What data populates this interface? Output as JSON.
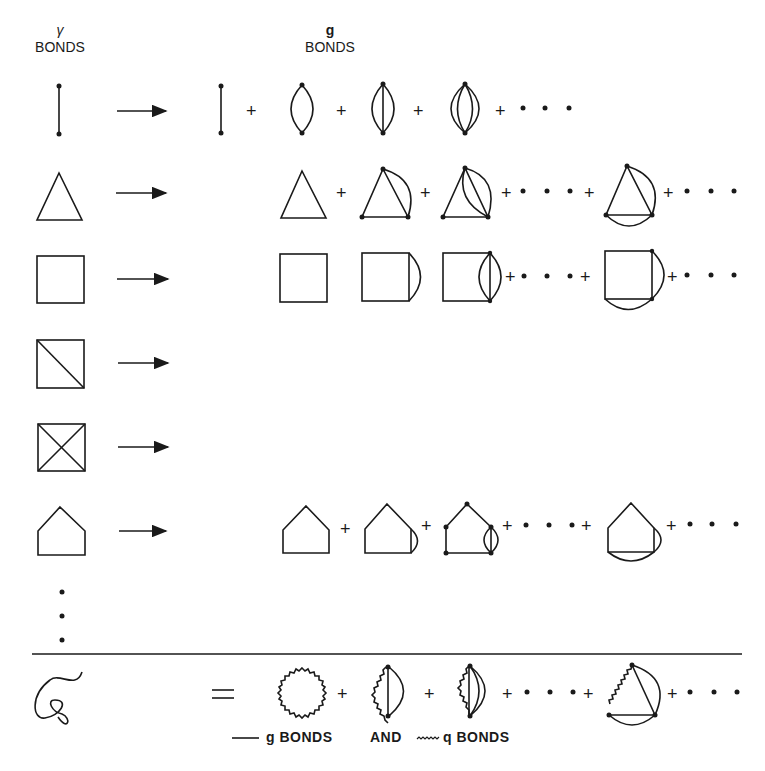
{
  "headers": {
    "left": {
      "symbol": "γ",
      "label": "BONDS"
    },
    "right": {
      "symbol": "g",
      "label": "BONDS"
    }
  },
  "rows": [
    {
      "name": "single-bond",
      "lhs": "line",
      "arrow": true,
      "rhs_terms": [
        "line",
        "+",
        "lens-2",
        "+",
        "lens-3",
        "+",
        "lens-4",
        "+ · · ·"
      ]
    },
    {
      "name": "triangle",
      "lhs": "triangle",
      "arrow": true,
      "rhs_terms": [
        "triangle",
        "+",
        "triangle-1arc",
        "+",
        "triangle-2arc",
        "+ · · · +",
        "triangle-2arcs-sides",
        "+ · · ·"
      ]
    },
    {
      "name": "square",
      "lhs": "square",
      "arrow": true,
      "rhs_terms": [
        "square",
        "square-1arc",
        "square-2arc",
        "+ · · · +",
        "square-2arcs-sides",
        "+ · · ·"
      ]
    },
    {
      "name": "square-diagonal",
      "lhs": "square-one-diagonal",
      "arrow": true,
      "rhs_terms": []
    },
    {
      "name": "square-cross",
      "lhs": "square-two-diagonals",
      "arrow": true,
      "rhs_terms": []
    },
    {
      "name": "pentagon",
      "lhs": "pentagon",
      "arrow": true,
      "rhs_terms": [
        "pentagon",
        "+",
        "pentagon-1arc",
        "+",
        "pentagon-2arc",
        "+ · · · +",
        "pentagon-2arcs-sides",
        "+ · · ·"
      ]
    }
  ],
  "continuation": "⋮",
  "bottom": {
    "lhs": "squiggle-S",
    "equals": "=",
    "rhs_terms": [
      "wavy-ring",
      "+",
      "wavy-lens-1",
      "+",
      "wavy-lens-2",
      "+ · · · +",
      "wavy-triangle",
      "+ · · ·"
    ]
  },
  "legend": {
    "g_label": "g BONDS",
    "and": "AND",
    "q_label": "q BONDS"
  },
  "plus": "+",
  "dots": "· · ·"
}
